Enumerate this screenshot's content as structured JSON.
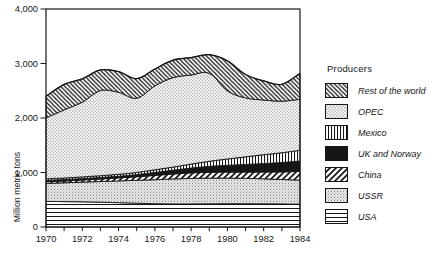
{
  "figure": {
    "legend_title": "Producers",
    "y_axis_label": "Million metric tons"
  },
  "colors": {
    "ink": "#161616",
    "background": "#ffffff",
    "stipple_base": "#e9e8e6",
    "stipple_dot": "#8d8d8d"
  },
  "chart_data": {
    "type": "area",
    "stacked": true,
    "title": "",
    "xlabel": "",
    "ylabel": "Million metric tons",
    "ylim": [
      0,
      4000
    ],
    "xlim": [
      1970,
      1984
    ],
    "grid": false,
    "legend_position": "right",
    "y_ticks": [
      0,
      1000,
      2000,
      3000,
      4000
    ],
    "y_tick_labels": [
      "0",
      "1,000",
      "2,000",
      "3,000",
      "4,000"
    ],
    "x_tick_labels": [
      "1970",
      "1972",
      "1974",
      "1976",
      "1978",
      "1980",
      "1982",
      "1984"
    ],
    "minor_x_tick_every_year": true,
    "years": [
      1970,
      1971,
      1972,
      1973,
      1974,
      1975,
      1976,
      1977,
      1978,
      1979,
      1980,
      1981,
      1982,
      1983,
      1984
    ],
    "series": [
      {
        "name": "USA",
        "pattern": "horizontal-lines",
        "values": [
          470,
          466,
          462,
          455,
          446,
          436,
          428,
          424,
          424,
          426,
          428,
          428,
          426,
          423,
          420
        ]
      },
      {
        "name": "USSR",
        "pattern": "fine-stipple",
        "values": [
          330,
          345,
          362,
          380,
          400,
          420,
          440,
          458,
          468,
          472,
          470,
          465,
          458,
          448,
          440
        ]
      },
      {
        "name": "China",
        "pattern": "diagonal-hatch-forward",
        "values": [
          30,
          33,
          38,
          45,
          55,
          65,
          78,
          90,
          100,
          106,
          110,
          115,
          125,
          140,
          160
        ]
      },
      {
        "name": "UK and Norway",
        "pattern": "solid-black",
        "values": [
          25,
          25,
          26,
          28,
          30,
          40,
          55,
          70,
          90,
          110,
          125,
          140,
          155,
          172,
          190
        ]
      },
      {
        "name": "Mexico",
        "pattern": "vertical-lines",
        "values": [
          30,
          30,
          32,
          34,
          36,
          40,
          48,
          58,
          72,
          92,
          115,
          140,
          162,
          180,
          200
        ]
      },
      {
        "name": "OPEC",
        "pattern": "sparse-dots",
        "values": [
          1115,
          1250,
          1370,
          1560,
          1505,
          1360,
          1540,
          1640,
          1635,
          1615,
          1250,
          1080,
          1005,
          945,
          935
        ]
      },
      {
        "name": "Rest of the world",
        "pattern": "diagonal-hatch-back",
        "values": [
          400,
          470,
          430,
          380,
          380,
          360,
          310,
          320,
          320,
          340,
          550,
          430,
          350,
          310,
          475
        ]
      }
    ],
    "legend_order_top_to_bottom": [
      "Rest of the world",
      "OPEC",
      "Mexico",
      "UK and Norway",
      "China",
      "USSR",
      "USA"
    ]
  }
}
